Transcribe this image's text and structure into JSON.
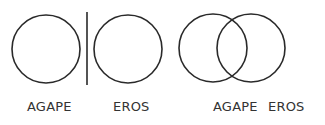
{
  "diagram": {
    "left_panel": {
      "labels": [
        "AGAPE",
        "EROS"
      ],
      "separated": true
    },
    "right_panel": {
      "labels": [
        "AGAPE",
        "EROS"
      ],
      "overlapping": true
    },
    "stroke_color": "#2a2a2a"
  }
}
